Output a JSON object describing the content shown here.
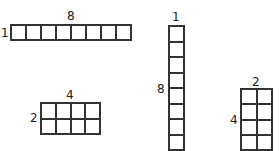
{
  "diagram": {
    "arrays": [
      {
        "rows": 1,
        "cols": 8,
        "row_label": "1",
        "col_label": "8"
      },
      {
        "rows": 2,
        "cols": 4,
        "row_label": "2",
        "col_label": "4"
      },
      {
        "rows": 8,
        "cols": 1,
        "row_label": "8",
        "col_label": "1"
      },
      {
        "rows": 4,
        "cols": 2,
        "row_label": "4",
        "col_label": "2"
      }
    ]
  }
}
